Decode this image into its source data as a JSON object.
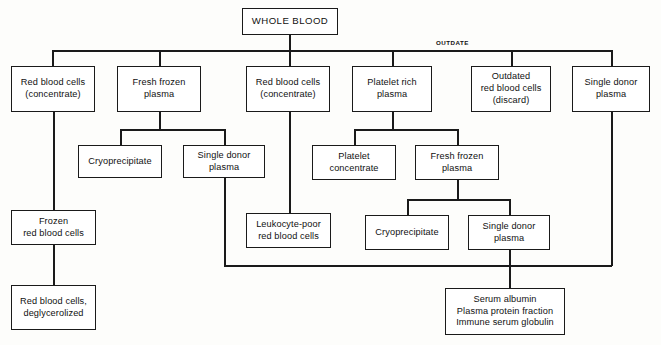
{
  "diagram": {
    "background_color": "#fdfdfb",
    "line_color": "#1a1a1a",
    "box_fill": "#ffffff",
    "annotations": {
      "outdate": "OUTDATE"
    },
    "nodes": [
      {
        "id": "whole-blood",
        "label": "WHOLE BLOOD",
        "x": 242,
        "y": 8,
        "w": 96,
        "h": 27
      },
      {
        "id": "rbc-concentrate-left",
        "label": "Red blood cells\n(concentrate)",
        "x": 11,
        "y": 66,
        "w": 84,
        "h": 46
      },
      {
        "id": "fresh-frozen-plasma-1",
        "label": "Fresh frozen\nplasma",
        "x": 117,
        "y": 66,
        "w": 84,
        "h": 46
      },
      {
        "id": "rbc-concentrate-mid",
        "label": "Red blood cells\n(concentrate)",
        "x": 246,
        "y": 66,
        "w": 84,
        "h": 46
      },
      {
        "id": "platelet-rich-plasma",
        "label": "Platelet rich\nplasma",
        "x": 352,
        "y": 66,
        "w": 80,
        "h": 46
      },
      {
        "id": "outdated-rbc",
        "label": "Outdated\nred blood cells\n(discard)",
        "x": 471,
        "y": 66,
        "w": 80,
        "h": 46
      },
      {
        "id": "single-donor-plasma-top",
        "label": "Single donor\nplasma",
        "x": 572,
        "y": 66,
        "w": 78,
        "h": 46
      },
      {
        "id": "cryoprecipitate-1",
        "label": "Cryoprecipitate",
        "x": 78,
        "y": 145,
        "w": 84,
        "h": 33
      },
      {
        "id": "single-donor-plasma-1",
        "label": "Single donor\nplasma",
        "x": 183,
        "y": 145,
        "w": 82,
        "h": 33
      },
      {
        "id": "platelet-concentrate",
        "label": "Platelet\nconcentrate",
        "x": 312,
        "y": 145,
        "w": 84,
        "h": 35
      },
      {
        "id": "fresh-frozen-plasma-2",
        "label": "Fresh frozen\nplasma",
        "x": 415,
        "y": 145,
        "w": 84,
        "h": 35
      },
      {
        "id": "frozen-rbc",
        "label": "Frozen\nred blood cells",
        "x": 11,
        "y": 210,
        "w": 85,
        "h": 35
      },
      {
        "id": "leukocyte-poor-rbc",
        "label": "Leukocyte-poor\nred blood cells",
        "x": 246,
        "y": 213,
        "w": 85,
        "h": 35
      },
      {
        "id": "cryoprecipitate-2",
        "label": "Cryoprecipitate",
        "x": 365,
        "y": 215,
        "w": 84,
        "h": 35
      },
      {
        "id": "single-donor-plasma-2",
        "label": "Single donor\nplasma",
        "x": 468,
        "y": 215,
        "w": 82,
        "h": 35
      },
      {
        "id": "rbc-deglycerolized",
        "label": "Red blood cells,\ndeglycerolized",
        "x": 11,
        "y": 285,
        "w": 85,
        "h": 45
      },
      {
        "id": "plasma-derivatives",
        "label": "Serum albumin\nPlasma protein fraction\nImmune serum globulin",
        "x": 445,
        "y": 288,
        "w": 120,
        "h": 47
      }
    ],
    "edges": [
      {
        "id": "whole-blood-stem",
        "type": "v",
        "x": 289,
        "y": 35,
        "len": 15
      },
      {
        "id": "main-bus",
        "type": "h",
        "x": 52,
        "y": 50,
        "len": 559
      },
      {
        "id": "drop-rbc-left",
        "type": "v",
        "x": 52,
        "y": 50,
        "len": 16
      },
      {
        "id": "drop-ffp1",
        "type": "v",
        "x": 159,
        "y": 50,
        "len": 16
      },
      {
        "id": "drop-rbc-mid",
        "type": "v",
        "x": 289,
        "y": 50,
        "len": 16
      },
      {
        "id": "drop-prp",
        "type": "v",
        "x": 392,
        "y": 50,
        "len": 16
      },
      {
        "id": "drop-outdated",
        "type": "v",
        "x": 511,
        "y": 50,
        "len": 16
      },
      {
        "id": "drop-sdp-top",
        "type": "v",
        "x": 611,
        "y": 50,
        "len": 16
      },
      {
        "id": "ffp1-stem",
        "type": "v",
        "x": 159,
        "y": 112,
        "len": 17
      },
      {
        "id": "ffp1-bus",
        "type": "h",
        "x": 120,
        "y": 129,
        "len": 105
      },
      {
        "id": "drop-cryo1",
        "type": "v",
        "x": 120,
        "y": 129,
        "len": 16
      },
      {
        "id": "drop-sdp1",
        "type": "v",
        "x": 224,
        "y": 129,
        "len": 16
      },
      {
        "id": "rbc-left-stem",
        "type": "v",
        "x": 53,
        "y": 112,
        "len": 98
      },
      {
        "id": "frozen-to-degly",
        "type": "v",
        "x": 53,
        "y": 245,
        "len": 40
      },
      {
        "id": "rbc-mid-stem",
        "type": "v",
        "x": 289,
        "y": 112,
        "len": 101
      },
      {
        "id": "prp-stem",
        "type": "v",
        "x": 392,
        "y": 112,
        "len": 17
      },
      {
        "id": "prp-bus",
        "type": "h",
        "x": 354,
        "y": 129,
        "len": 103
      },
      {
        "id": "drop-platelet-conc",
        "type": "v",
        "x": 354,
        "y": 129,
        "len": 16
      },
      {
        "id": "drop-ffp2",
        "type": "v",
        "x": 457,
        "y": 129,
        "len": 16
      },
      {
        "id": "ffp2-stem",
        "type": "v",
        "x": 457,
        "y": 180,
        "len": 19
      },
      {
        "id": "ffp2-bus",
        "type": "h",
        "x": 407,
        "y": 199,
        "len": 103
      },
      {
        "id": "drop-cryo2",
        "type": "v",
        "x": 407,
        "y": 199,
        "len": 16
      },
      {
        "id": "drop-sdp2",
        "type": "v",
        "x": 509,
        "y": 199,
        "len": 16
      },
      {
        "id": "sdp1-down",
        "type": "v",
        "x": 224,
        "y": 178,
        "len": 88
      },
      {
        "id": "sdp-top-down",
        "type": "v",
        "x": 611,
        "y": 112,
        "len": 154
      },
      {
        "id": "bottom-bus",
        "type": "h",
        "x": 224,
        "y": 265,
        "len": 388
      },
      {
        "id": "sdp2-to-bottom",
        "type": "v",
        "x": 509,
        "y": 250,
        "len": 15
      },
      {
        "id": "bottom-to-derivatives",
        "type": "v",
        "x": 509,
        "y": 265,
        "len": 23
      }
    ]
  }
}
